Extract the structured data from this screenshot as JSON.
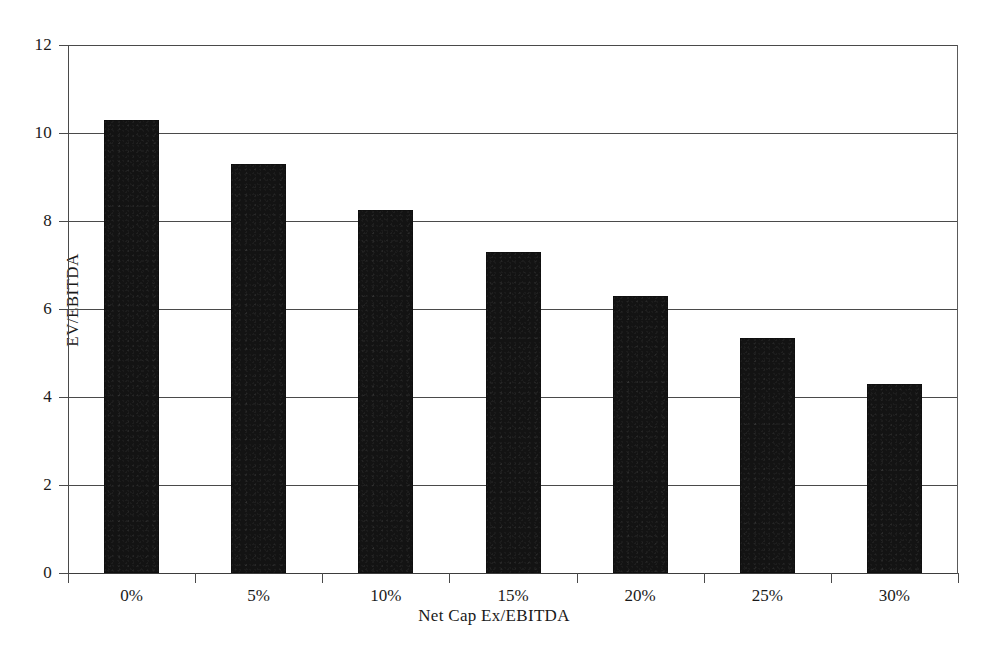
{
  "chart_data": {
    "type": "bar",
    "title": "",
    "subtitle": "",
    "xlabel": "Net Cap Ex/EBITDA",
    "ylabel": "EV/EBITDA",
    "categories": [
      "0%",
      "5%",
      "10%",
      "15%",
      "20%",
      "25%",
      "30%"
    ],
    "values": [
      10.3,
      9.3,
      8.25,
      7.3,
      6.3,
      5.35,
      4.3
    ],
    "series": [
      {
        "name": "EV/EBITDA",
        "values": [
          10.3,
          9.3,
          8.25,
          7.3,
          6.3,
          5.35,
          4.3
        ]
      }
    ],
    "ylim": [
      0,
      12
    ],
    "yticks": [
      0,
      2,
      4,
      6,
      8,
      10,
      12
    ],
    "ytick_labels": [
      "0",
      "2",
      "4",
      "6",
      "8",
      "10",
      "12"
    ],
    "grid": true,
    "grid_axis": "y",
    "legend": false,
    "legend_position": "none",
    "bar_color": "#131313",
    "axis_color": "#4a4a4a",
    "background_color": "#ffffff"
  },
  "axes": {
    "y_title": "EV/EBITDA",
    "x_title": "Net Cap Ex/EBITDA"
  },
  "footer": {
    "caption": ""
  }
}
